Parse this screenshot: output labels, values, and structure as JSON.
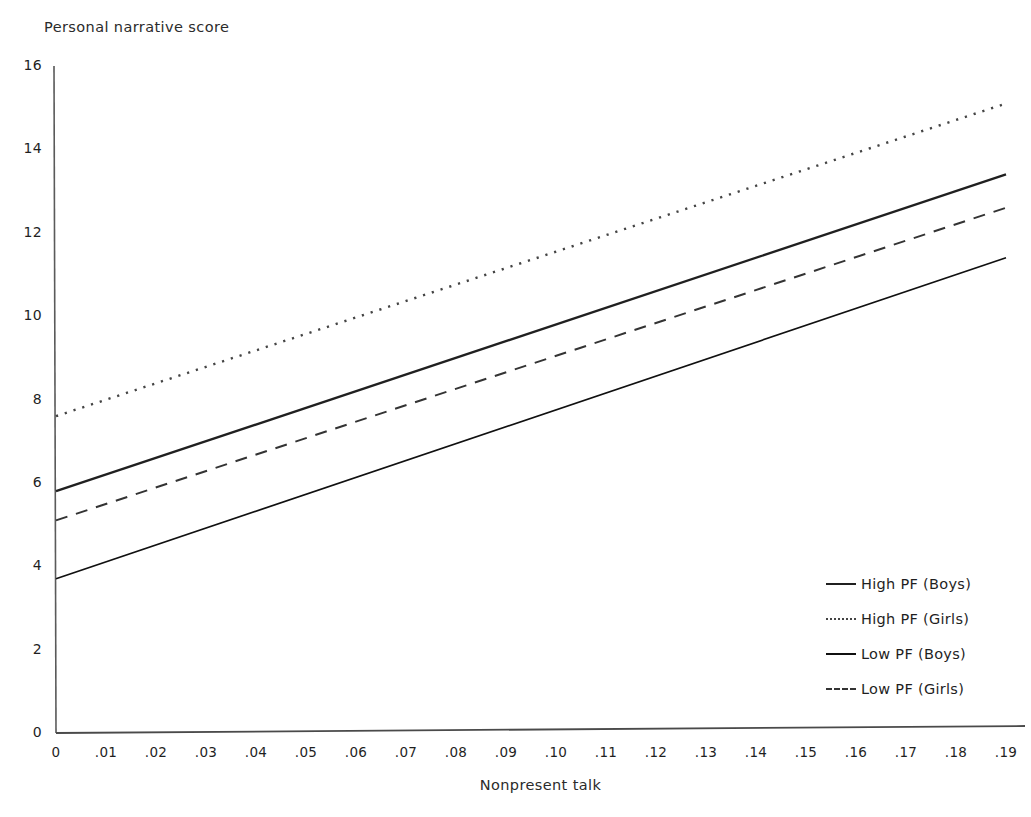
{
  "chart_data": {
    "type": "line",
    "title": "",
    "ylabel": "Personal narrative score",
    "xlabel": "Nonpresent talk",
    "xlim": [
      0,
      0.19
    ],
    "ylim": [
      0,
      16
    ],
    "grid": false,
    "legend_position": "right-inside",
    "xticks": [
      "0",
      ".01",
      ".02",
      ".03",
      ".04",
      ".05",
      ".06",
      ".07",
      ".08",
      ".09",
      ".10",
      ".11",
      ".12",
      ".13",
      ".14",
      ".15",
      ".16",
      ".17",
      ".18",
      ".19"
    ],
    "xtick_values": [
      0,
      0.01,
      0.02,
      0.03,
      0.04,
      0.05,
      0.06,
      0.07,
      0.08,
      0.09,
      0.1,
      0.11,
      0.12,
      0.13,
      0.14,
      0.15,
      0.16,
      0.17,
      0.18,
      0.19
    ],
    "yticks": [
      "0",
      "2",
      "4",
      "6",
      "8",
      "10",
      "12",
      "14",
      "16"
    ],
    "ytick_values": [
      0,
      2,
      4,
      6,
      8,
      10,
      12,
      14,
      16
    ],
    "x": [
      0,
      0.19
    ],
    "series": [
      {
        "name": "High PF (Boys)",
        "style": "solid-thick",
        "color": "#202020",
        "values": [
          5.8,
          13.4
        ]
      },
      {
        "name": "High PF (Girls)",
        "style": "dotted",
        "color": "#444444",
        "values": [
          7.6,
          15.1
        ]
      },
      {
        "name": "Low PF (Boys)",
        "style": "solid-thin",
        "color": "#101010",
        "values": [
          3.7,
          11.4
        ]
      },
      {
        "name": "Low PF (Girls)",
        "style": "dashed",
        "color": "#333333",
        "values": [
          5.1,
          12.6
        ]
      }
    ]
  }
}
